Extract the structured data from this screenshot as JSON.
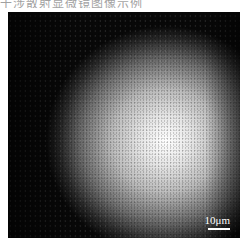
{
  "caption": {
    "text": "干涉散射显微镜图像示例"
  },
  "image": {
    "description": "Grayscale microscopy image with bright central illumination spot and speckle noise",
    "scale_bar": {
      "label": "10μm",
      "color": "#ffffff"
    }
  }
}
